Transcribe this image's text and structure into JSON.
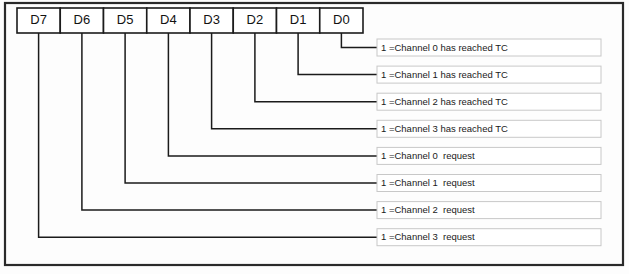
{
  "diagram": {
    "frame": {
      "x": 5,
      "y": 3,
      "width": 618,
      "height": 262
    },
    "colors": {
      "background": "#fdfdfd",
      "line": "#1b1b1b",
      "frame_border": "#2a2a2a",
      "label_border": "#c8c8c8",
      "box_fill": "#ffffff",
      "text": "#121212"
    },
    "bit_boxes": {
      "x_start": 17,
      "y_top": 8,
      "height": 25,
      "cell_width": 43.25,
      "items": [
        {
          "label": "D7",
          "center_x": 38.6
        },
        {
          "label": "D6",
          "center_x": 81.9
        },
        {
          "label": "D5",
          "center_x": 125.1
        },
        {
          "label": "D4",
          "center_x": 168.4
        },
        {
          "label": "D3",
          "center_x": 211.6
        },
        {
          "label": "D2",
          "center_x": 254.9
        },
        {
          "label": "D1",
          "center_x": 298.1
        },
        {
          "label": "D0",
          "center_x": 341.4
        }
      ]
    },
    "label_boxes": {
      "x_left": 377,
      "x_right": 601,
      "height": 17,
      "first_center_y": 47.5,
      "row_spacing": 27.1,
      "items": [
        {
          "bit": "D0",
          "text": "1 =Channel 0 has reached TC",
          "center_y": 47.5,
          "leader_x": 341.4
        },
        {
          "bit": "D1",
          "text": "1 =Channel 1 has reached TC",
          "center_y": 74.6,
          "leader_x": 298.1
        },
        {
          "bit": "D2",
          "text": "1 =Channel 2 has reached TC",
          "center_y": 101.7,
          "leader_x": 254.9
        },
        {
          "bit": "D3",
          "text": "1 =Channel 3 has reached TC",
          "center_y": 128.8,
          "leader_x": 211.6
        },
        {
          "bit": "D4",
          "text": "1 =Channel 0  request",
          "center_y": 155.9,
          "leader_x": 168.4
        },
        {
          "bit": "D5",
          "text": "1 =Channel 1  request",
          "center_y": 183.0,
          "leader_x": 125.1
        },
        {
          "bit": "D6",
          "text": "1 =Channel 2  request",
          "center_y": 210.1,
          "leader_x": 81.9
        },
        {
          "bit": "D7",
          "text": "1 =Channel 3  request",
          "center_y": 237.2,
          "leader_x": 38.6
        }
      ]
    }
  }
}
